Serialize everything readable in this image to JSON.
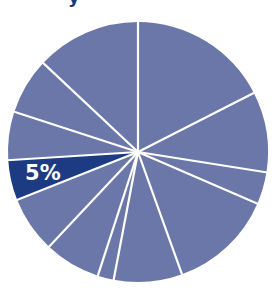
{
  "header": {
    "title_fragment": "y"
  },
  "colors": {
    "base_slice": "#6a77a8",
    "highlight_slice": "#1c3b82",
    "separator": "#ffffff",
    "background": "#ffffff"
  },
  "chart_data": {
    "type": "pie",
    "title": "",
    "start_angle": "12 o'clock, clockwise",
    "categories": [
      "Slice 1",
      "Slice 2",
      "Slice 3",
      "Slice 4",
      "Slice 5",
      "Slice 6",
      "Slice 7",
      "Slice 8",
      "Slice 9",
      "Slice 10",
      "Slice 11",
      "Slice 12"
    ],
    "values": [
      17.5,
      10,
      4,
      13,
      8.5,
      2,
      7,
      7,
      5,
      6,
      7,
      13
    ],
    "highlighted_index": 8,
    "annotations": [
      {
        "slice_index": 8,
        "text": "5%"
      }
    ],
    "legend": "none",
    "grid": false
  }
}
